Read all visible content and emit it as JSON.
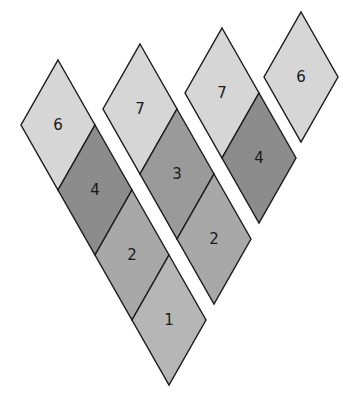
{
  "diagram": {
    "cell_geometry": {
      "half_width": 37,
      "half_height": 65
    },
    "colors": {
      "light": "#d6d6d6",
      "dark": "#8c8c8c",
      "mid": "#9a9a9a",
      "medium": "#a8a8a8",
      "pale": "#b6b6b6"
    },
    "strips": [
      {
        "id": "strip-1",
        "cells": [
          {
            "label": "6",
            "top": [
              58,
              60
            ],
            "shade": "light"
          },
          {
            "label": "4",
            "top": [
              95,
              125
            ],
            "shade": "dark"
          },
          {
            "label": "2",
            "top": [
              132,
              190
            ],
            "shade": "medium"
          },
          {
            "label": "1",
            "top": [
              169,
              255
            ],
            "shade": "pale"
          }
        ]
      },
      {
        "id": "strip-2",
        "cells": [
          {
            "label": "7",
            "top": [
              140,
              44
            ],
            "shade": "light"
          },
          {
            "label": "3",
            "top": [
              177,
              109
            ],
            "shade": "mid"
          },
          {
            "label": "2",
            "top": [
              214,
              174
            ],
            "shade": "medium"
          }
        ]
      },
      {
        "id": "strip-3",
        "cells": [
          {
            "label": "7",
            "top": [
              222,
              28
            ],
            "shade": "light"
          },
          {
            "label": "4",
            "top": [
              259,
              93
            ],
            "shade": "dark"
          }
        ]
      },
      {
        "id": "strip-4",
        "cells": [
          {
            "label": "6",
            "top": [
              301,
              12
            ],
            "shade": "light"
          }
        ]
      }
    ]
  }
}
